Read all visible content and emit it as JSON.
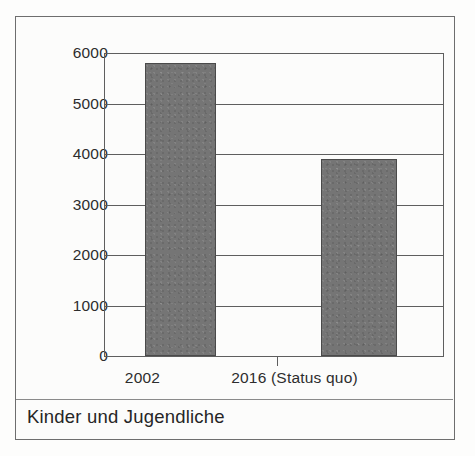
{
  "caption": "Kinder und Jugendliche",
  "colors": {
    "bar_fill": "#757575",
    "bar_stroke": "#4a4a4a",
    "gridline": "#5e5e5e",
    "frame": "#6e6e6e",
    "background": "#fcfcfb",
    "text": "#2d2d2d"
  },
  "chart_data": {
    "type": "bar",
    "title": "",
    "subtitle": "",
    "xlabel": "",
    "ylabel": "",
    "categories": [
      "2002",
      "2016 (Status quo)"
    ],
    "values": [
      5800,
      3900
    ],
    "series": [
      {
        "name": "Kinder und Jugendliche",
        "values": [
          5800,
          3900
        ]
      }
    ],
    "ylim": [
      0,
      6000
    ],
    "yticks": [
      0,
      1000,
      2000,
      3000,
      4000,
      5000,
      6000
    ],
    "ytick_labels": [
      "0",
      "1000",
      "2000",
      "3000",
      "4000",
      "5000",
      "6000"
    ],
    "grid": true,
    "legend": false,
    "legend_position": "none",
    "annotations": []
  }
}
